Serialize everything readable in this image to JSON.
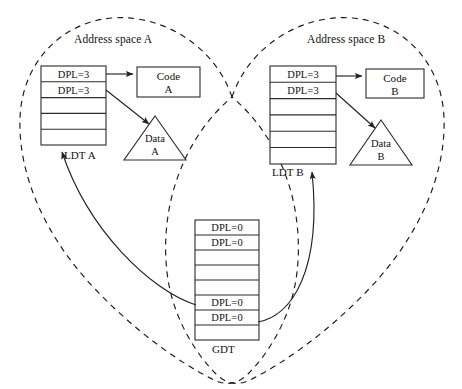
{
  "figure": {
    "regions": [
      {
        "key": "a",
        "title": "Address space A"
      },
      {
        "key": "b",
        "title": "Address space B"
      }
    ],
    "tables": [
      {
        "id": "ldt-a",
        "name": "LDT A",
        "rows": [
          "DPL=3",
          "DPL=3",
          "",
          "",
          ""
        ]
      },
      {
        "id": "ldt-b",
        "name": "LDT B",
        "rows": [
          "DPL=3",
          "DPL=3",
          "",
          "",
          "",
          ""
        ]
      },
      {
        "id": "gdt",
        "name": "GDT",
        "rows": [
          "DPL=0",
          "DPL=0",
          "",
          "",
          "",
          "DPL=0",
          "DPL=0",
          ""
        ]
      }
    ],
    "segments": [
      {
        "id": "code-a",
        "shape": "rect",
        "line1": "Code",
        "line2": "A"
      },
      {
        "id": "data-a",
        "shape": "triangle",
        "line1": "Data",
        "line2": "A"
      },
      {
        "id": "code-b",
        "shape": "rect",
        "line1": "Code",
        "line2": "B"
      },
      {
        "id": "data-b",
        "shape": "triangle",
        "line1": "Data",
        "line2": "B"
      }
    ],
    "colors": {
      "stroke": "#2b2b2b",
      "dashed": "#1a1a1a",
      "text": "#111111",
      "background": "#ffffff"
    }
  }
}
